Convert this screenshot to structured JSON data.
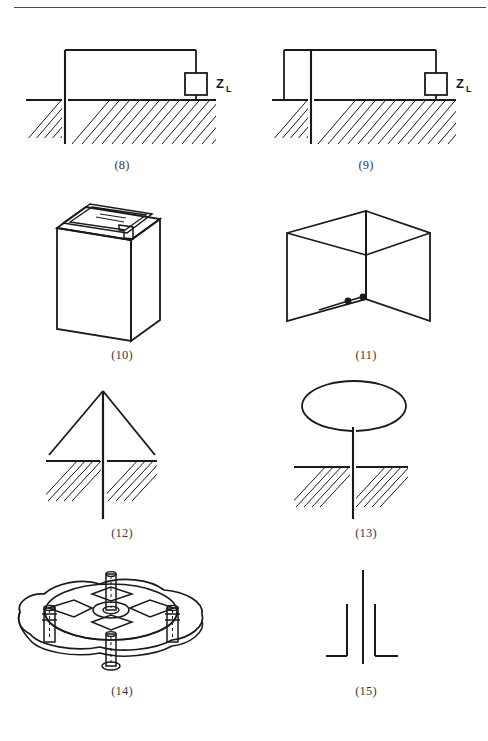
{
  "page": {
    "background_color": "#ffffff",
    "ink_color": "#1a1a1a",
    "rule_color": "#4a4a4a"
  },
  "top_rule": {
    "name": "horizontal-rule",
    "visible": true
  },
  "figures": [
    {
      "caption": "(8)",
      "name": "grounded-monopole-with-load",
      "description": "Vertical conductor penetrating hatched ground, horizontal top wire to square load impedance box returning to ground",
      "load_label": "Z",
      "load_subscript": "L"
    },
    {
      "caption": "(9)",
      "name": "grounded-monopole-with-stub-and-load",
      "description": "Vertical conductor through ground with additional short left stub to ground level, top wire to square load impedance box",
      "load_label": "Z",
      "load_subscript": "L"
    },
    {
      "caption": "(10)",
      "name": "slotted-box-antenna",
      "description": "Isometric rectangular box with narrow longitudinal slot along the top face and feed tab",
      "load_label": "",
      "load_subscript": ""
    },
    {
      "caption": "(11)",
      "name": "crossed-plate-antenna",
      "description": "Two intersecting perpendicular rectangular plates with two feed terminals at the centre base",
      "load_label": "",
      "load_subscript": ""
    },
    {
      "caption": "(12)",
      "name": "umbrella-top-loaded-monopole",
      "description": "Vertical mast with two sloping top-load wires forming a triangle above hatched ground",
      "load_label": "",
      "load_subscript": ""
    },
    {
      "caption": "(13)",
      "name": "capacitive-top-hat-monopole",
      "description": "Vertical mast with large elliptical top-hat disc above hatched ground",
      "load_label": "",
      "load_subscript": ""
    },
    {
      "caption": "(14)",
      "name": "radial-hub-ground-plane-assembly",
      "description": "Perspective view of irregular base plate with raised circular hub, four radial arms and four cylindrical insulator posts",
      "load_label": "",
      "load_subscript": ""
    },
    {
      "caption": "(15)",
      "name": "skirted-monopole-outline",
      "description": "Tall vertical element flanked by two shorter vertical elements with small horizontal feet",
      "load_label": "",
      "load_subscript": ""
    }
  ]
}
